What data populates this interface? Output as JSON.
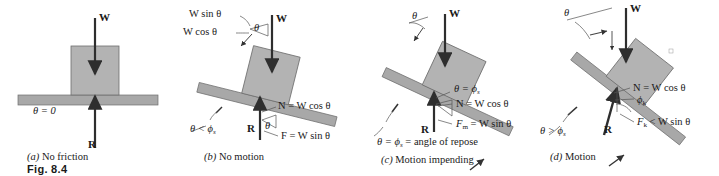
{
  "figure": {
    "number_label": "Fig. 8.4",
    "colors": {
      "block_fill": "#b3b3b3",
      "block_stroke": "#6e6e6e",
      "plane_fill": "#a8a8a8",
      "plane_stroke": "#6e6e6e",
      "arrow": "#333333",
      "text": "#1a1a1a",
      "background": "#ffffff"
    },
    "panels": [
      {
        "id": "a",
        "caption_tag": "(a)",
        "caption_text": "No friction",
        "incline_angle_deg": 0,
        "labels": [
          {
            "name": "weight-vector-label",
            "text": "W"
          },
          {
            "name": "reaction-vector-label",
            "text": "R"
          },
          {
            "name": "theta-zero-label",
            "text": "θ = 0"
          }
        ]
      },
      {
        "id": "b",
        "caption_tag": "(b)",
        "caption_text": "No motion",
        "incline_angle_deg": 14,
        "labels": [
          {
            "name": "w-sin-theta-label",
            "text": "W sin θ"
          },
          {
            "name": "w-cos-theta-label",
            "text": "W cos θ"
          },
          {
            "name": "weight-vector-label",
            "text": "W"
          },
          {
            "name": "theta-wedge-label",
            "text": "θ"
          },
          {
            "name": "normal-force-label",
            "text": "N = W cos θ"
          },
          {
            "name": "friction-force-label",
            "text": "F = W sin θ"
          },
          {
            "name": "reaction-vector-label",
            "text": "R"
          },
          {
            "name": "theta-at-r-label",
            "text": "θ"
          },
          {
            "name": "theta-less-phis-label",
            "text": "θ < ϕ",
            "sub": "s"
          }
        ]
      },
      {
        "id": "c",
        "caption_tag": "(c)",
        "caption_text": "Motion impending",
        "incline_angle_deg": 25,
        "labels": [
          {
            "name": "theta-incline-label",
            "text": "θ"
          },
          {
            "name": "weight-vector-label",
            "text": "W"
          },
          {
            "name": "theta-equals-phis-label",
            "text": "θ = ϕ",
            "sub": "s"
          },
          {
            "name": "normal-force-label",
            "text": "N = W cos θ"
          },
          {
            "name": "max-friction-label",
            "text": "F",
            "sub": "m",
            "text_tail": " = W sin θ"
          },
          {
            "name": "reaction-vector-label",
            "text": "R"
          },
          {
            "name": "angle-of-repose-label",
            "text": "θ = ϕ",
            "sub": "s",
            "text_tail": " = angle of repose"
          }
        ]
      },
      {
        "id": "d",
        "caption_tag": "(d)",
        "caption_text": "Motion",
        "incline_angle_deg": 38,
        "labels": [
          {
            "name": "theta-incline-label",
            "text": "θ"
          },
          {
            "name": "weight-vector-label",
            "text": "W"
          },
          {
            "name": "normal-force-label",
            "text": "N = W cos θ"
          },
          {
            "name": "phi-k-label",
            "text": "ϕ",
            "sub": "k"
          },
          {
            "name": "kinetic-friction-label",
            "text": "F",
            "sub": "k",
            "text_tail": " < W sin θ"
          },
          {
            "name": "reaction-vector-label",
            "text": "R"
          },
          {
            "name": "theta-greater-phis-label",
            "text": "θ > ϕ",
            "sub": "s"
          }
        ]
      }
    ]
  },
  "text": {
    "a": {
      "W": "W",
      "R": "R",
      "theta0": "θ = 0",
      "tag": "(a)",
      "caption": "No friction",
      "figno": "Fig. 8.4"
    },
    "b": {
      "wsin": "W sin θ",
      "wcos": "W cos θ",
      "W": "W",
      "theta": "θ",
      "thetaR": "θ",
      "N": "N = W cos θ",
      "F": "F = W sin θ",
      "R": "R",
      "thetaphi_a": "θ < ϕ",
      "thetaphi_sub": "s",
      "tag": "(b)",
      "caption": "No motion"
    },
    "c": {
      "theta": "θ",
      "W": "W",
      "thetaeq_a": "θ = ϕ",
      "thetaeq_sub": "s",
      "N": "N = W cos θ",
      "Fm_a": "F",
      "Fm_sub": "m",
      "Fm_b": " = W sin θ",
      "R": "R",
      "repose_a": "θ = ϕ",
      "repose_sub": "s",
      "repose_b": " = angle of repose",
      "tag": "(c)",
      "caption": "Motion impending"
    },
    "d": {
      "theta": "θ",
      "W": "W",
      "N": "N = W cos θ",
      "phik_a": "ϕ",
      "phik_sub": "k",
      "Fk_a": "F",
      "Fk_sub": "k",
      "Fk_b": " < W sin θ",
      "R": "R",
      "thetagt_a": "θ > ϕ",
      "thetagt_sub": "s",
      "tag": "(d)",
      "caption": "Motion"
    }
  }
}
